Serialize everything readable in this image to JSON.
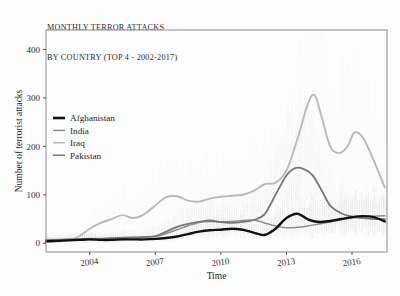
{
  "figure": {
    "title_lines": [
      "MONTHLY TERROR ATTACKS",
      "BY COUNTRY (TOP 4 - 2002-2017)"
    ],
    "background_color": "#fdfdfd",
    "panel_border_color": "#8c8c8c"
  },
  "chart_data": {
    "type": "line",
    "title": "MONTHLY TERROR ATTACKS BY COUNTRY (TOP 4 - 2002-2017)",
    "xlabel": "Time",
    "ylabel": "Number of terrorist attacks",
    "xlim": [
      2002.0,
      2017.6
    ],
    "ylim": [
      -18,
      440
    ],
    "xticks": [
      2004,
      2007,
      2010,
      2013,
      2016
    ],
    "xtick_labels": [
      "2004",
      "2007",
      "2010",
      "2013",
      "2016"
    ],
    "yticks": [
      0,
      100,
      200,
      300,
      400
    ],
    "ytick_labels": [
      "0",
      "100",
      "200",
      "300",
      "400"
    ],
    "grid": false,
    "legend_position": "upper-left-inside",
    "note": "Thin dotted vertical traces show the raw monthly counts; bold curves are smoothed trends.",
    "series": [
      {
        "name": "Afghanistan",
        "color": "#111111",
        "linewidth": 2.4,
        "x": [
          2002.0,
          2002.5,
          2003.0,
          2003.5,
          2004.0,
          2004.5,
          2005.0,
          2005.5,
          2006.0,
          2006.5,
          2007.0,
          2007.5,
          2008.0,
          2008.5,
          2009.0,
          2009.5,
          2010.0,
          2010.5,
          2011.0,
          2011.5,
          2012.0,
          2012.5,
          2013.0,
          2013.5,
          2014.0,
          2014.5,
          2015.0,
          2015.5,
          2016.0,
          2016.5,
          2017.0,
          2017.5
        ],
        "values": [
          4,
          5,
          6,
          7,
          8,
          7,
          7,
          8,
          8,
          8,
          9,
          11,
          14,
          19,
          24,
          27,
          28,
          30,
          28,
          22,
          17,
          30,
          52,
          61,
          49,
          44,
          46,
          50,
          54,
          56,
          54,
          45
        ]
      },
      {
        "name": "India",
        "color": "#8e8e8e",
        "linewidth": 1.5,
        "x": [
          2002.0,
          2002.5,
          2003.0,
          2003.5,
          2004.0,
          2004.5,
          2005.0,
          2005.5,
          2006.0,
          2006.5,
          2007.0,
          2007.5,
          2008.0,
          2008.5,
          2009.0,
          2009.5,
          2010.0,
          2010.5,
          2011.0,
          2011.5,
          2012.0,
          2012.5,
          2013.0,
          2013.5,
          2014.0,
          2014.5,
          2015.0,
          2015.5,
          2016.0,
          2016.5,
          2017.0,
          2017.5
        ],
        "values": [
          8,
          8,
          9,
          9,
          10,
          10,
          11,
          12,
          12,
          13,
          14,
          20,
          28,
          36,
          43,
          45,
          44,
          45,
          47,
          48,
          42,
          36,
          32,
          33,
          36,
          40,
          44,
          49,
          52,
          55,
          56,
          57
        ]
      },
      {
        "name": "Iraq",
        "color": "#b9b9b9",
        "linewidth": 1.9,
        "x": [
          2002.0,
          2002.5,
          2003.0,
          2003.5,
          2004.0,
          2004.5,
          2005.0,
          2005.5,
          2006.0,
          2006.5,
          2007.0,
          2007.5,
          2008.0,
          2008.5,
          2009.0,
          2009.5,
          2010.0,
          2010.5,
          2011.0,
          2011.5,
          2012.0,
          2012.5,
          2013.0,
          2013.5,
          2014.0,
          2014.3,
          2014.6,
          2015.0,
          2015.4,
          2015.8,
          2016.1,
          2016.5,
          2017.0,
          2017.5
        ],
        "values": [
          3,
          4,
          6,
          14,
          30,
          42,
          50,
          58,
          52,
          60,
          78,
          95,
          97,
          88,
          86,
          92,
          96,
          98,
          100,
          108,
          122,
          125,
          150,
          215,
          290,
          305,
          262,
          200,
          186,
          200,
          228,
          218,
          170,
          115
        ]
      },
      {
        "name": "Pakistan",
        "color": "#787878",
        "linewidth": 1.8,
        "x": [
          2002.0,
          2002.5,
          2003.0,
          2003.5,
          2004.0,
          2004.5,
          2005.0,
          2005.5,
          2006.0,
          2006.5,
          2007.0,
          2007.5,
          2008.0,
          2008.5,
          2009.0,
          2009.5,
          2010.0,
          2010.5,
          2011.0,
          2011.5,
          2012.0,
          2012.5,
          2013.0,
          2013.4,
          2013.8,
          2014.2,
          2014.6,
          2015.0,
          2015.5,
          2016.0,
          2016.5,
          2017.0,
          2017.5
        ],
        "values": [
          5,
          6,
          7,
          8,
          8,
          9,
          10,
          11,
          12,
          13,
          15,
          24,
          34,
          40,
          44,
          47,
          44,
          42,
          44,
          48,
          60,
          100,
          140,
          155,
          153,
          140,
          110,
          78,
          62,
          55,
          52,
          50,
          50
        ]
      }
    ]
  },
  "legend": {
    "items": [
      {
        "label": "Afghanistan",
        "color": "#111111"
      },
      {
        "label": "India",
        "color": "#8e8e8e"
      },
      {
        "label": "Iraq",
        "color": "#b9b9b9"
      },
      {
        "label": "Pakistan",
        "color": "#787878"
      }
    ]
  }
}
